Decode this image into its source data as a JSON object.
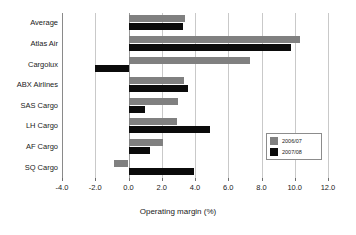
{
  "chart_data": {
    "type": "bar",
    "orientation": "horizontal",
    "title": "",
    "xlabel": "Operating margin (%)",
    "ylabel": "",
    "xlim": [
      -4.0,
      12.0
    ],
    "xticks": [
      -4.0,
      -2.0,
      0.0,
      2.0,
      4.0,
      6.0,
      8.0,
      10.0,
      12.0
    ],
    "xtick_labels": [
      "-4.0",
      "-2.0",
      "0.0",
      "2.0",
      "4.0",
      "6.0",
      "8.0",
      "10.0",
      "12.0"
    ],
    "grid": true,
    "grid_axis": "x",
    "legend_position": "right-inside",
    "categories": [
      "Average",
      "Atlas Air",
      "Cargolux",
      "ABX Airlines",
      "SAS Cargo",
      "LH Cargo",
      "AF Cargo",
      "SQ Cargo"
    ],
    "series": [
      {
        "name": "2006/07",
        "color": "#808080",
        "values": [
          3.4,
          10.3,
          7.3,
          3.35,
          3.0,
          2.9,
          2.1,
          -0.9
        ]
      },
      {
        "name": "2007/08",
        "color": "#0b0b0b",
        "values": [
          3.3,
          9.8,
          -2.0,
          3.6,
          1.0,
          4.9,
          1.3,
          3.95
        ]
      }
    ]
  },
  "legend": {
    "entries": [
      {
        "label": "2006/07"
      },
      {
        "label": "2007/08"
      }
    ]
  },
  "colors": {
    "series_2006_07": "#808080",
    "series_2007_08": "#0b0b0b",
    "gridline": "#c9c9c9",
    "axis": "#8a8a8a",
    "text": "#1a1a1a",
    "background": "#ffffff"
  }
}
